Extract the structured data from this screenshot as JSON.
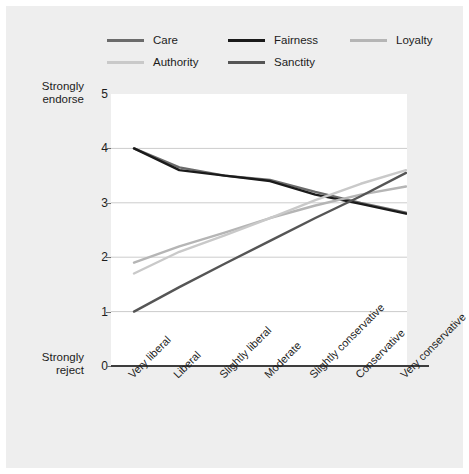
{
  "figure": {
    "background_color": "#eeeeee",
    "plot_background_color": "#ffffff",
    "axis_color": "#3d3d3d",
    "grid_color": "#cccccc"
  },
  "legend": {
    "position": "top",
    "entries": [
      {
        "label": "Care",
        "color": "#6b6b6b",
        "row": 0,
        "col": 0
      },
      {
        "label": "Fairness",
        "color": "#1a1a1a",
        "row": 0,
        "col": 1
      },
      {
        "label": "Loyalty",
        "color": "#b5b5b5",
        "row": 0,
        "col": 2
      },
      {
        "label": "Authority",
        "color": "#c9c9c9",
        "row": 1,
        "col": 0
      },
      {
        "label": "Sanctity",
        "color": "#555555",
        "row": 1,
        "col": 1
      }
    ]
  },
  "y_axis": {
    "caption_top_line1": "Strongly",
    "caption_top_line2": "endorse",
    "caption_bottom_line1": "Strongly",
    "caption_bottom_line2": "reject",
    "ticks": [
      "5",
      "4",
      "3",
      "2",
      "1",
      "0"
    ],
    "min": 0,
    "max": 5
  },
  "x_axis": {
    "categories": [
      "Very liberal",
      "Liberal",
      "Slightly liberal",
      "Moderate",
      "Slightly conservative",
      "Conservative",
      "Very conservative"
    ]
  },
  "chart_data": {
    "type": "line",
    "title": "",
    "xlabel": "",
    "ylabel": "Strongly reject to Strongly endorse",
    "ylim": [
      0,
      5
    ],
    "grid": true,
    "legend_position": "top",
    "categories": [
      "Very liberal",
      "Liberal",
      "Slightly liberal",
      "Moderate",
      "Slightly conservative",
      "Conservative",
      "Very conservative"
    ],
    "series": [
      {
        "name": "Care",
        "color": "#6b6b6b",
        "values": [
          4.0,
          3.65,
          3.5,
          3.42,
          3.2,
          3.0,
          2.82
        ]
      },
      {
        "name": "Fairness",
        "color": "#1a1a1a",
        "values": [
          4.0,
          3.6,
          3.5,
          3.4,
          3.15,
          2.98,
          2.8
        ]
      },
      {
        "name": "Loyalty",
        "color": "#b5b5b5",
        "values": [
          1.9,
          2.2,
          2.45,
          2.72,
          2.95,
          3.15,
          3.3
        ]
      },
      {
        "name": "Authority",
        "color": "#c9c9c9",
        "values": [
          1.7,
          2.1,
          2.4,
          2.72,
          3.05,
          3.35,
          3.6
        ]
      },
      {
        "name": "Sanctity",
        "color": "#555555",
        "values": [
          1.0,
          1.45,
          1.88,
          2.3,
          2.72,
          3.12,
          3.55
        ]
      }
    ]
  }
}
